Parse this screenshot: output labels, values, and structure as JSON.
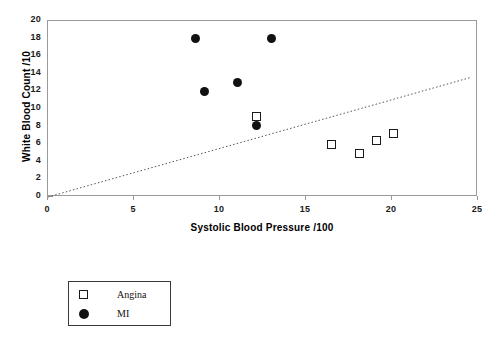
{
  "chart_data": {
    "type": "scatter",
    "title": "",
    "xlabel": "Systolic Blood Pressure /100",
    "ylabel": "White Blood Count /10",
    "xlim": [
      0,
      25
    ],
    "ylim": [
      0,
      20
    ],
    "xticks": [
      0,
      5,
      10,
      15,
      20,
      25
    ],
    "yticks": [
      0,
      2,
      4,
      6,
      8,
      10,
      12,
      14,
      16,
      18,
      20
    ],
    "grid": false,
    "legend_position": "below-left",
    "series": [
      {
        "name": "Angina",
        "marker": "open-square",
        "color": "#1a1a1a",
        "points": [
          {
            "x": 12.1,
            "y": 9.2
          },
          {
            "x": 16.5,
            "y": 6.0
          },
          {
            "x": 18.1,
            "y": 5.0
          },
          {
            "x": 19.1,
            "y": 6.4
          },
          {
            "x": 20.1,
            "y": 7.2
          }
        ]
      },
      {
        "name": "MI",
        "marker": "filled-circle",
        "color": "#111111",
        "points": [
          {
            "x": 8.6,
            "y": 18.0
          },
          {
            "x": 13.0,
            "y": 18.0
          },
          {
            "x": 9.1,
            "y": 12.0
          },
          {
            "x": 11.0,
            "y": 13.0
          },
          {
            "x": 12.1,
            "y": 8.1
          }
        ]
      }
    ],
    "trendline": {
      "style": "dotted",
      "color": "#555555",
      "from": {
        "x": 0,
        "y": 0
      },
      "to": {
        "x": 24.6,
        "y": 13.6
      }
    }
  },
  "legend": {
    "entries": [
      {
        "label": "Angina",
        "marker": "open-square"
      },
      {
        "label": "MI",
        "marker": "filled-circle"
      }
    ]
  },
  "axis_titles": {
    "x": "Systolic Blood Pressure /100",
    "y": "White Blood Count /10"
  }
}
